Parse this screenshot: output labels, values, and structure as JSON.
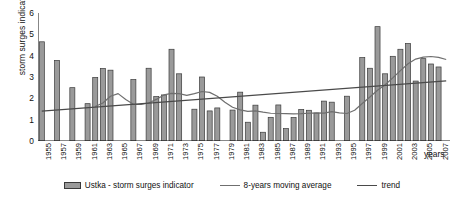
{
  "chart_data": {
    "type": "bar",
    "title": "",
    "subtitle": "",
    "xlabel": "years",
    "ylabel": "storm surges indicator",
    "ylim": [
      0,
      6
    ],
    "yticks": [
      0,
      1,
      2,
      3,
      4,
      5,
      6
    ],
    "grid": false,
    "legend_position": "bottom",
    "categories": [
      "1955",
      "1956",
      "1957",
      "1958",
      "1959",
      "1960",
      "1961",
      "1962",
      "1963",
      "1964",
      "1965",
      "1966",
      "1967",
      "1968",
      "1969",
      "1970",
      "1971",
      "1972",
      "1973",
      "1974",
      "1975",
      "1976",
      "1977",
      "1978",
      "1979",
      "1980",
      "1981",
      "1982",
      "1983",
      "1984",
      "1985",
      "1986",
      "1987",
      "1988",
      "1989",
      "1990",
      "1991",
      "1992",
      "1993",
      "1994",
      "1995",
      "1996",
      "1997",
      "1998",
      "1999",
      "2000",
      "2001",
      "2002",
      "2003",
      "2004",
      "2005",
      "2006",
      "2007",
      "2008"
    ],
    "xtick_labels": [
      "1955",
      "1957",
      "1959",
      "1961",
      "1963",
      "1965",
      "1967",
      "1969",
      "1971",
      "1973",
      "1975",
      "1977",
      "1979",
      "1981",
      "1983",
      "1985",
      "1987",
      "1989",
      "1991",
      "1993",
      "1995",
      "1997",
      "1999",
      "2001",
      "2003",
      "2005",
      "2007"
    ],
    "series": [
      {
        "name": "Ustka - storm surges indicator",
        "type": "bar",
        "color": "#9a9a9a",
        "edge_color": "#3a3a3a",
        "values": [
          4.65,
          0,
          3.78,
          0,
          2.5,
          0,
          1.75,
          2.98,
          3.4,
          3.32,
          0,
          0,
          2.88,
          0,
          3.41,
          2.08,
          2.16,
          4.3,
          3.15,
          0,
          1.49,
          3.0,
          1.41,
          1.55,
          0,
          1.45,
          2.29,
          0.88,
          1.68,
          0.41,
          1.11,
          1.69,
          0.58,
          1.1,
          1.48,
          1.44,
          1.31,
          1.87,
          1.82,
          0,
          2.1,
          0,
          3.91,
          3.41,
          5.36,
          3.15,
          3.97,
          4.3,
          4.57,
          2.81,
          3.86,
          3.61,
          3.47,
          0
        ]
      },
      {
        "name": "8-years moving average",
        "type": "line",
        "color": "#6f6f6f",
        "values": [
          null,
          null,
          null,
          null,
          null,
          null,
          null,
          1.62,
          1.78,
          2.1,
          2.22,
          1.95,
          1.72,
          1.71,
          1.78,
          1.95,
          2.16,
          2.23,
          2.22,
          2.14,
          2.22,
          2.32,
          2.28,
          2.1,
          1.82,
          1.58,
          1.46,
          1.39,
          1.41,
          1.35,
          1.3,
          1.29,
          1.28,
          1.27,
          1.28,
          1.3,
          1.32,
          1.31,
          1.38,
          1.32,
          1.29,
          1.44,
          1.76,
          2.06,
          2.38,
          2.64,
          2.96,
          3.3,
          3.62,
          3.84,
          3.93,
          3.96,
          3.92,
          3.82
        ]
      },
      {
        "name": "trend",
        "type": "line",
        "color": "#4a4a4a",
        "start_value": 1.4,
        "end_value": 2.82
      }
    ]
  },
  "legend": {
    "items": [
      {
        "label": "Ustka - storm surges indicator",
        "marker": "bar-swatch"
      },
      {
        "label": "8-years moving average",
        "marker": "line-swatch"
      },
      {
        "label": "trend",
        "marker": "line-swatch"
      }
    ]
  }
}
